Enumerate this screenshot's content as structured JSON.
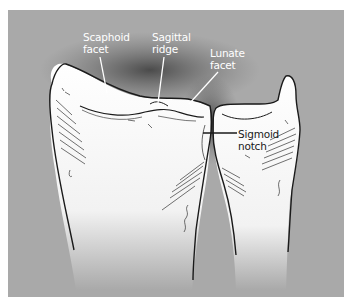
{
  "figure": {
    "background_color": "#a9a9a9",
    "bone_color": "#f4f4f4",
    "outline_color": "#1a1a1a",
    "labels": {
      "scaphoid_facet": {
        "line1": "Scaphoid",
        "line2": "facet"
      },
      "sagittal_ridge": {
        "line1": "Sagittal",
        "line2": "ridge"
      },
      "lunate_facet": {
        "line1": "Lunate",
        "line2": "facet"
      },
      "sigmoid_notch": {
        "line1": "Sigmoid",
        "line2": "notch"
      }
    }
  }
}
